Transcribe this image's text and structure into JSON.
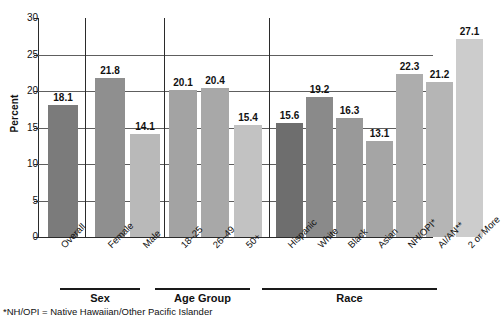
{
  "chart_data": {
    "type": "bar",
    "title": "",
    "xlabel": "",
    "ylabel": "Percent",
    "ylim": [
      0,
      30
    ],
    "ytick_labels": [
      "0",
      "5",
      "10",
      "15",
      "20",
      "25",
      "30"
    ],
    "ytick_values": [
      0,
      5,
      10,
      15,
      20,
      25,
      30
    ],
    "grid": "horizontal",
    "legend": "none",
    "categories": [
      "Overall",
      "Female",
      "Male",
      "18–25",
      "26–49",
      "50+",
      "Hispanic",
      "White",
      "Black",
      "Asian",
      "NH/OPI*",
      "AI/AN**",
      "2 or More"
    ],
    "values": [
      18.1,
      21.8,
      14.1,
      20.1,
      20.4,
      15.4,
      15.6,
      19.2,
      16.3,
      13.1,
      22.3,
      21.2,
      27.1
    ],
    "value_labels": [
      "18.1",
      "21.8",
      "14.1",
      "20.1",
      "20.4",
      "15.4",
      "15.6",
      "19.2",
      "16.3",
      "13.1",
      "22.3",
      "21.2",
      "27.1"
    ],
    "bar_colors": [
      "#7b7b7b",
      "#8f8f8f",
      "#b9b9b9",
      "#a3a3a3",
      "#a8a8a8",
      "#c2c2c2",
      "#6e6e6e",
      "#8a8a8a",
      "#999999",
      "#a5a5a5",
      "#adadad",
      "#b5b5b5",
      "#cccccc"
    ],
    "groups": [
      {
        "name": "",
        "categories": [
          "Overall"
        ]
      },
      {
        "name": "Sex",
        "categories": [
          "Female",
          "Male"
        ]
      },
      {
        "name": "Age Group",
        "categories": [
          "18–25",
          "26–49",
          "50+"
        ]
      },
      {
        "name": "Race",
        "categories": [
          "Hispanic",
          "White",
          "Black",
          "Asian",
          "NH/OPI*",
          "AI/AN**",
          "2 or More"
        ]
      }
    ],
    "annotations": [
      "*NH/OPI = Native Hawaiian/Other Pacific Islander"
    ]
  },
  "axis": {
    "y_title": "Percent"
  },
  "group_labels": {
    "sex": "Sex",
    "age_group": "Age Group",
    "race": "Race"
  },
  "footnote": "*NH/OPI = Native Hawaiian/Other Pacific Islander"
}
